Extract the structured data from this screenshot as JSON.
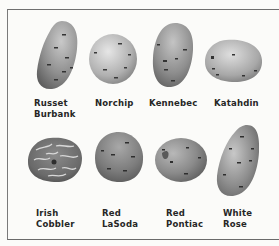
{
  "figure": {
    "rows": [
      {
        "items": [
          {
            "name": "Russet Burbank",
            "label_line1": "Russet",
            "label_line2": "Burbank",
            "shape": "elongated-oval",
            "skin": "russet-netted"
          },
          {
            "name": "Norchip",
            "label_line1": "Norchip",
            "label_line2": "",
            "shape": "round",
            "skin": "smooth-white"
          },
          {
            "name": "Kennebec",
            "label_line1": "Kennebec",
            "label_line2": "",
            "shape": "oblong",
            "skin": "smooth-white"
          },
          {
            "name": "Katahdin",
            "label_line1": "Katahdin",
            "label_line2": "",
            "shape": "oval-flat",
            "skin": "smooth-white"
          }
        ]
      },
      {
        "items": [
          {
            "name": "Irish Cobbler",
            "label_line1": "Irish",
            "label_line2": "Cobbler",
            "shape": "round-irregular",
            "skin": "deep-eyed"
          },
          {
            "name": "Red LaSoda",
            "label_line1": "Red",
            "label_line2": "LaSoda",
            "shape": "round",
            "skin": "red-smooth"
          },
          {
            "name": "Red Pontiac",
            "label_line1": "Red",
            "label_line2": "Pontiac",
            "shape": "round-oval",
            "skin": "red-smooth"
          },
          {
            "name": "White Rose",
            "label_line1": "White",
            "label_line2": "Rose",
            "shape": "long-oval",
            "skin": "smooth-white"
          }
        ]
      }
    ]
  },
  "colors": {
    "background": "#fbfbf9",
    "border": "#6f6f6f",
    "label_text": "#262626",
    "potato_dark": "#6e6e6e",
    "potato_mid": "#9a9a9a",
    "potato_light": "#d2d2d2"
  }
}
